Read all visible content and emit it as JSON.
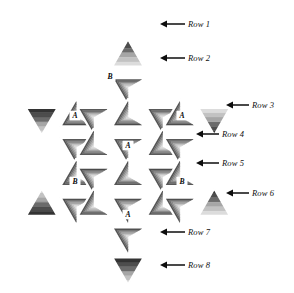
{
  "figure": {
    "background_color": "#ffffff"
  },
  "palette": {
    "band_darkest": "#333333",
    "band_dark": "#4d4d4d",
    "band_mid_dark": "#6b6b6b",
    "band_mid": "#8a8a8a",
    "band_mid_light": "#a6a6a6",
    "band_light": "#c2c2c2",
    "band_lightest": "#dcdcdc",
    "gap": "#ffffff",
    "ink": "#0d0d0d"
  },
  "row_labels": [
    {
      "id": "row-1",
      "text": "Row 1",
      "label_x": 188,
      "label_y": 27,
      "arrow_from_x": 185,
      "arrow_to_x": 160,
      "arrow_y": 24
    },
    {
      "id": "row-2",
      "text": "Row 2",
      "label_x": 188,
      "label_y": 61,
      "arrow_from_x": 185,
      "arrow_to_x": 160,
      "arrow_y": 58
    },
    {
      "id": "row-3",
      "text": "Row 3",
      "label_x": 252,
      "label_y": 108,
      "arrow_from_x": 249,
      "arrow_to_x": 226,
      "arrow_y": 105
    },
    {
      "id": "row-4",
      "text": "Row 4",
      "label_x": 222,
      "label_y": 137,
      "arrow_from_x": 219,
      "arrow_to_x": 196,
      "arrow_y": 134
    },
    {
      "id": "row-5",
      "text": "Row 5",
      "label_x": 222,
      "label_y": 166,
      "arrow_from_x": 219,
      "arrow_to_x": 196,
      "arrow_y": 163
    },
    {
      "id": "row-6",
      "text": "Row 6",
      "label_x": 252,
      "label_y": 196,
      "arrow_from_x": 249,
      "arrow_to_x": 226,
      "arrow_y": 193
    },
    {
      "id": "row-7",
      "text": "Row 7",
      "label_x": 188,
      "label_y": 235,
      "arrow_from_x": 185,
      "arrow_to_x": 160,
      "arrow_y": 232
    },
    {
      "id": "row-8",
      "text": "Row 8",
      "label_x": 188,
      "label_y": 268,
      "arrow_from_x": 185,
      "arrow_to_x": 160,
      "arrow_y": 265
    }
  ],
  "node_labels": [
    {
      "id": "node-b-top",
      "text": "B",
      "x": 110,
      "y": 79
    },
    {
      "id": "node-a-left",
      "text": "A",
      "x": 75,
      "y": 118
    },
    {
      "id": "node-a-right",
      "text": "A",
      "x": 182,
      "y": 118
    },
    {
      "id": "node-a-center",
      "text": "A",
      "x": 128,
      "y": 148
    },
    {
      "id": "node-b-lower-left",
      "text": "B",
      "x": 75,
      "y": 184
    },
    {
      "id": "node-b-lower-right",
      "text": "B",
      "x": 182,
      "y": 184
    },
    {
      "id": "node-a-bottom",
      "text": "A",
      "x": 128,
      "y": 217
    }
  ],
  "chart_data": {
    "type": "diagram",
    "rows": [
      {
        "row": 1,
        "tiles": 1,
        "orientation": "up",
        "note": "star top point"
      },
      {
        "row": 2,
        "tiles": 1,
        "orientation": "down",
        "note": "upper inner cell"
      },
      {
        "row": 3,
        "tiles": 5,
        "orientation": "mixed",
        "note": "upper arm row with outer left/right points"
      },
      {
        "row": 4,
        "tiles": 4,
        "orientation": "mixed",
        "note": "upper middle row"
      },
      {
        "row": 5,
        "tiles": 4,
        "orientation": "mixed",
        "note": "lower middle row"
      },
      {
        "row": 6,
        "tiles": 5,
        "orientation": "mixed",
        "note": "lower arm row with outer left/right points"
      },
      {
        "row": 7,
        "tiles": 1,
        "orientation": "down",
        "note": "lower inner cell"
      },
      {
        "row": 8,
        "tiles": 1,
        "orientation": "down",
        "note": "star bottom point"
      }
    ],
    "junction_types": [
      "A",
      "B"
    ],
    "junction_counts": {
      "A": 4,
      "B": 3
    }
  }
}
